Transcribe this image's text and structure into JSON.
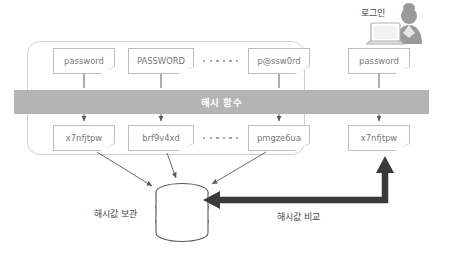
{
  "diagram": {
    "title_hidden": "",
    "hash_band": {
      "label": "해시 함수",
      "color": "#b4b4b4",
      "text_color": "#ffffff"
    },
    "group_label": "",
    "inputs": [
      {
        "id": "input-1",
        "text": "password"
      },
      {
        "id": "input-2",
        "text": "PASSWORD"
      },
      {
        "id": "input-3",
        "text": "p@ssw0rd"
      }
    ],
    "outputs": [
      {
        "id": "output-1",
        "text": "x7nfjtpw"
      },
      {
        "id": "output-2",
        "text": "brf9v4xd"
      },
      {
        "id": "output-3",
        "text": "pmgze6ua"
      }
    ],
    "login": {
      "label": "로그인",
      "input": {
        "id": "login-input",
        "text": "password"
      },
      "output": {
        "id": "login-output",
        "text": "x7nfjtpw"
      }
    },
    "ellipsis": {
      "count": 6,
      "char": "•"
    },
    "captions": {
      "store": "해시값 보관",
      "compare": "해시값 비교"
    },
    "database": {
      "name": "hash-database",
      "segments": 3
    },
    "colors": {
      "band": "#b4b4b4",
      "note_border": "#bdbdbd",
      "note_text": "#777777",
      "thin_arrow": "#5a5a5a",
      "thick_arrow": "#3a3a3a",
      "caption_text": "#4a4a4a",
      "group_border": "#cfcfcf",
      "person": "#9a9a9a",
      "background": "#ffffff"
    }
  }
}
